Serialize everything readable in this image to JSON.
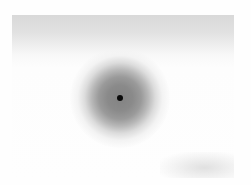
{
  "image": {
    "description": "Grayscale blurred photo with a dark circular blob and a small black dot at its center",
    "colors": {
      "background": "#fefefe",
      "top_band": "#d9d9d9",
      "blob_core": "#838383",
      "dot": "#0a0a0a"
    }
  }
}
